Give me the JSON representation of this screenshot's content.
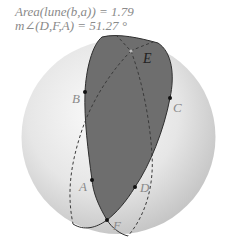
{
  "measurements": {
    "area_label": "Area(lune(b,a)) = 1.79",
    "angle_label": "m∠(D,F,A) = 51.27 °"
  },
  "points": {
    "A": {
      "label": "A",
      "x": 92,
      "y": 180
    },
    "B": {
      "label": "B",
      "x": 85,
      "y": 92
    },
    "C": {
      "label": "C",
      "x": 170,
      "y": 98
    },
    "D": {
      "label": "D",
      "x": 135,
      "y": 187
    },
    "E": {
      "label": "E",
      "x": 131,
      "y": 51
    },
    "F": {
      "label": "F",
      "x": 107,
      "y": 220
    }
  },
  "colors": {
    "lune_fill": "#6e6e6e",
    "sphere_light": "#f4f4f4",
    "sphere_dark": "#c8c8c8",
    "curve": "#333333",
    "label": "#8a8a8a",
    "label_E": "#222222"
  }
}
